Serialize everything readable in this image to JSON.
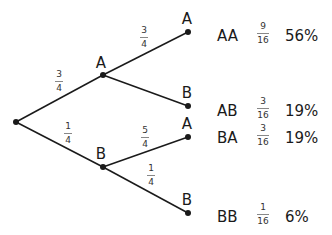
{
  "diagram": {
    "type": "probability-tree",
    "colors": {
      "line": "#1a1a1a",
      "node": "#1a1a1a",
      "text": "#1a1a1a"
    },
    "nodes": {
      "root": {
        "x": 16,
        "y": 122,
        "label": ""
      },
      "A": {
        "x": 103,
        "y": 75,
        "label": "A"
      },
      "B": {
        "x": 103,
        "y": 167,
        "label": "B"
      },
      "AA": {
        "x": 188,
        "y": 32,
        "label": "A"
      },
      "AB": {
        "x": 188,
        "y": 106,
        "label": "B"
      },
      "BA": {
        "x": 188,
        "y": 137,
        "label": "A"
      },
      "BB": {
        "x": 188,
        "y": 213,
        "label": "B"
      }
    },
    "branches": [
      {
        "from": "root",
        "to": "A",
        "prob": {
          "num": "3",
          "den": "4"
        }
      },
      {
        "from": "root",
        "to": "B",
        "prob": {
          "num": "1",
          "den": "4"
        }
      },
      {
        "from": "A",
        "to": "AA",
        "prob": {
          "num": "3",
          "den": "4"
        }
      },
      {
        "from": "A",
        "to": "AB",
        "prob": {
          "num": "",
          "den": ""
        }
      },
      {
        "from": "B",
        "to": "BA",
        "prob": {
          "num": "5",
          "den": "4"
        }
      },
      {
        "from": "B",
        "to": "BB",
        "prob": {
          "num": "1",
          "den": "4"
        }
      }
    ],
    "outcomes": [
      {
        "label": "AA",
        "num": "9",
        "den": "16",
        "percent": "56%"
      },
      {
        "label": "AB",
        "num": "3",
        "den": "16",
        "percent": "19%"
      },
      {
        "label": "BA",
        "num": "3",
        "den": "16",
        "percent": "19%"
      },
      {
        "label": "BB",
        "num": "1",
        "den": "16",
        "percent": "6%"
      }
    ]
  }
}
